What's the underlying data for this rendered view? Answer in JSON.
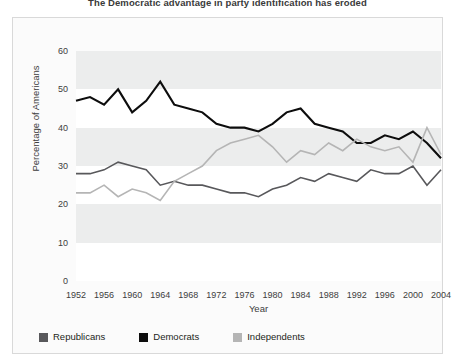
{
  "figure": {
    "title": "The Democratic advantage in party identification has eroded"
  },
  "legend": {
    "items": [
      {
        "label": "Republicans",
        "color": "#58585b"
      },
      {
        "label": "Democrats",
        "color": "#0d0d0d"
      },
      {
        "label": "Independents",
        "color": "#b5b5b5"
      }
    ]
  },
  "chart_data": {
    "type": "line",
    "title": "The Democratic advantage in party identification has eroded",
    "xlabel": "Year",
    "ylabel": "Percentage of Americans",
    "xlim": [
      1952,
      2004
    ],
    "ylim": [
      0,
      60
    ],
    "yticks": [
      0,
      10,
      20,
      30,
      40,
      50,
      60
    ],
    "xticks": [
      1952,
      1956,
      1960,
      1964,
      1968,
      1972,
      1976,
      1980,
      1984,
      1988,
      1992,
      1996,
      2000,
      2004
    ],
    "x": [
      1952,
      1954,
      1956,
      1958,
      1960,
      1962,
      1964,
      1966,
      1968,
      1970,
      1972,
      1974,
      1976,
      1978,
      1980,
      1982,
      1984,
      1986,
      1988,
      1990,
      1992,
      1994,
      1996,
      1998,
      2000,
      2002,
      2004
    ],
    "grid": "horizontal-bands",
    "legend_position": "bottom-left",
    "series": [
      {
        "name": "Democrats",
        "color": "#0d0d0d",
        "values": [
          47,
          48,
          46,
          50,
          44,
          47,
          52,
          46,
          45,
          44,
          41,
          40,
          40,
          39,
          41,
          44,
          45,
          41,
          40,
          39,
          36,
          36,
          38,
          37,
          39,
          36,
          32
        ]
      },
      {
        "name": "Republicans",
        "color": "#58585b",
        "values": [
          28,
          28,
          29,
          31,
          30,
          29,
          25,
          26,
          25,
          25,
          24,
          23,
          23,
          22,
          24,
          25,
          27,
          26,
          28,
          27,
          26,
          29,
          28,
          28,
          30,
          25,
          29
        ]
      },
      {
        "name": "Independents",
        "color": "#b5b5b5",
        "values": [
          23,
          23,
          25,
          22,
          24,
          23,
          21,
          26,
          28,
          30,
          34,
          36,
          37,
          38,
          35,
          31,
          34,
          33,
          36,
          34,
          37,
          35,
          34,
          35,
          31,
          40,
          33
        ]
      }
    ]
  }
}
